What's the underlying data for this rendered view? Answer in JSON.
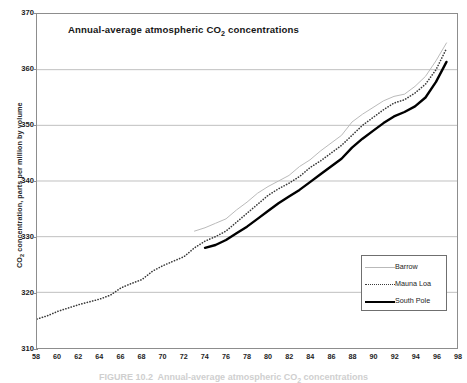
{
  "figure": {
    "caption": "FIGURE 10.2  Annual-average atmospheric CO2 concentrations"
  },
  "chart_data": {
    "type": "line",
    "title": "Annual-average atmospheric CO2 concentrations",
    "title_html": "Annual-average atmospheric CO<sub>2</sub> concentrations",
    "xlabel": "",
    "ylabel": "CO2 concentration, parts per million by volume",
    "ylabel_html": "CO<sub>2</sub> concentration, parts per million by volume",
    "xlim": [
      58,
      98
    ],
    "ylim": [
      310,
      370
    ],
    "xticks": [
      58,
      60,
      62,
      64,
      66,
      68,
      70,
      72,
      74,
      76,
      78,
      80,
      82,
      84,
      86,
      88,
      90,
      92,
      94,
      96,
      98
    ],
    "yticks": [
      310,
      320,
      330,
      340,
      350,
      360,
      370
    ],
    "grid": "horizontal",
    "legend_position": "bottom-right",
    "series": [
      {
        "name": "Barrow",
        "color": "#b9b9b9",
        "style": "solid-thin",
        "x": [
          73,
          74,
          75,
          76,
          77,
          78,
          79,
          80,
          81,
          82,
          83,
          84,
          85,
          86,
          87,
          88,
          89,
          90,
          91,
          92,
          93,
          94,
          95,
          96,
          97
        ],
        "values": [
          331.0,
          331.6,
          332.4,
          333.2,
          334.8,
          336.2,
          337.8,
          339.0,
          340.0,
          341.0,
          342.6,
          343.8,
          345.4,
          346.8,
          348.2,
          350.6,
          352.0,
          353.2,
          354.4,
          355.2,
          355.6,
          357.0,
          358.8,
          361.6,
          364.8
        ]
      },
      {
        "name": "Mauna Loa",
        "color": "#3a3a3a",
        "style": "dotted",
        "x": [
          58,
          59,
          60,
          61,
          62,
          63,
          64,
          65,
          66,
          67,
          68,
          69,
          70,
          71,
          72,
          73,
          74,
          75,
          76,
          77,
          78,
          79,
          80,
          81,
          82,
          83,
          84,
          85,
          86,
          87,
          88,
          89,
          90,
          91,
          92,
          93,
          94,
          95,
          96,
          97
        ],
        "values": [
          315.2,
          315.8,
          316.6,
          317.2,
          317.8,
          318.3,
          318.8,
          319.5,
          320.8,
          321.6,
          322.3,
          323.8,
          324.8,
          325.6,
          326.4,
          328.0,
          329.2,
          330.0,
          331.0,
          332.6,
          334.2,
          335.8,
          337.4,
          338.6,
          339.6,
          340.8,
          342.4,
          343.6,
          345.0,
          346.4,
          348.2,
          350.0,
          351.4,
          352.8,
          354.0,
          354.6,
          355.8,
          357.4,
          360.0,
          363.8
        ]
      },
      {
        "name": "South Pole",
        "color": "#000000",
        "style": "solid-thick",
        "x": [
          74,
          75,
          76,
          77,
          78,
          79,
          80,
          81,
          82,
          83,
          84,
          85,
          86,
          87,
          88,
          89,
          90,
          91,
          92,
          93,
          94,
          95,
          96,
          97
        ],
        "values": [
          328.0,
          328.5,
          329.4,
          330.6,
          331.8,
          333.2,
          334.6,
          336.0,
          337.2,
          338.4,
          339.8,
          341.2,
          342.6,
          344.0,
          346.0,
          347.6,
          349.0,
          350.4,
          351.6,
          352.4,
          353.4,
          355.0,
          357.8,
          361.4
        ]
      }
    ]
  },
  "legend": {
    "items": [
      {
        "label": "Barrow"
      },
      {
        "label": "Mauna Loa"
      },
      {
        "label": "South Pole"
      }
    ]
  }
}
